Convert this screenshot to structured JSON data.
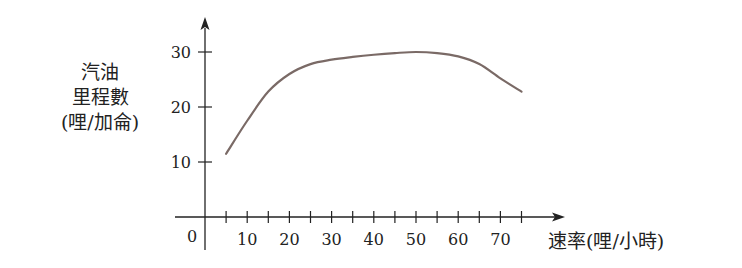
{
  "chart_data": {
    "type": "line",
    "title": "",
    "xlabel": "速率(哩/小時)",
    "ylabel_lines": [
      "汽油",
      "里程數",
      "(哩/加侖)"
    ],
    "origin_label": "0",
    "x_ticks": [
      10,
      20,
      30,
      40,
      50,
      60,
      70
    ],
    "x_minor_step": 5,
    "y_ticks": [
      10,
      20,
      30
    ],
    "xlim": [
      0,
      85
    ],
    "ylim": [
      0,
      32
    ],
    "grid": false,
    "series": [
      {
        "name": "gas mileage",
        "color": "#7a6a66",
        "x": [
          5,
          10,
          15,
          20,
          25,
          30,
          35,
          40,
          45,
          50,
          55,
          60,
          65,
          70,
          75
        ],
        "y": [
          11.5,
          17.5,
          22.8,
          26.0,
          27.8,
          28.6,
          29.1,
          29.5,
          29.8,
          30.0,
          29.8,
          29.2,
          27.8,
          25.2,
          22.8
        ]
      }
    ]
  },
  "labels": {
    "ylabel_line1": "汽油",
    "ylabel_line2": "里程數",
    "ylabel_line3": "(哩/加侖)",
    "xlabel": "速率(哩/小時)"
  }
}
